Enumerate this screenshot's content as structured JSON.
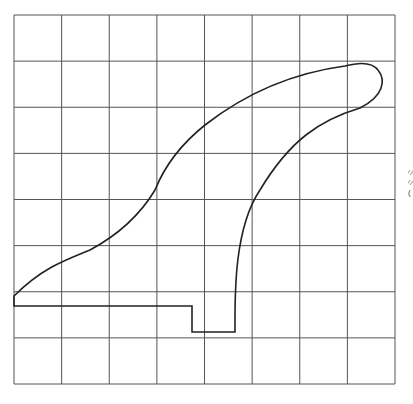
{
  "diagram": {
    "type": "grid-template",
    "grid": {
      "columns": 8,
      "rows": 8,
      "x0": 14,
      "y0": 15,
      "x1": 395,
      "y1": 384,
      "line_color": "#555555"
    },
    "shape": {
      "name": "fin-outline",
      "stroke": "#222222",
      "path": "M14,296 L14,306 L192,306 L192,332 L235,332 C235,300 233,230 260,190 C290,140 320,120 360,108 C384,96 386,80 378,70 C372,62 360,62 345,66 C300,72 250,90 205,125 C180,145 165,165 155,190 C140,215 118,235 90,250 C60,262 40,270 14,296 Z"
    },
    "edge_text": "⁄ ⁄ ⁄ ⁄ ("
  }
}
